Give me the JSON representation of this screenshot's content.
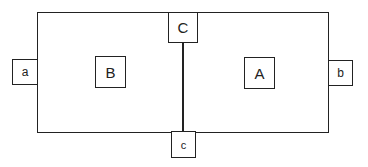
{
  "diagram": {
    "regions": [
      {
        "id": "B",
        "label": "B"
      },
      {
        "id": "A",
        "label": "A"
      }
    ],
    "top_connector": {
      "label": "C"
    },
    "bottom_connector": {
      "label": "c"
    },
    "left_port": {
      "label": "a"
    },
    "right_port": {
      "label": "b"
    }
  }
}
